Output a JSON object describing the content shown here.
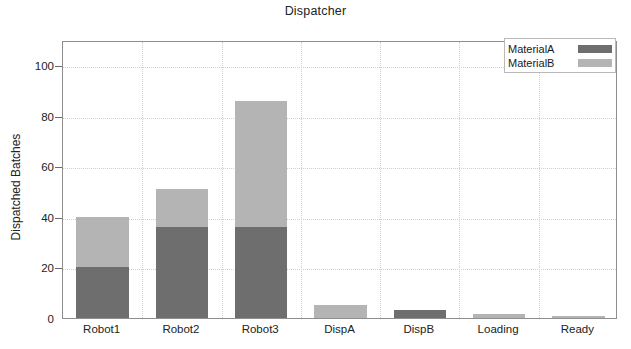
{
  "chart_data": {
    "type": "bar",
    "stacked": true,
    "title": "Dispatcher",
    "xlabel": "",
    "ylabel": "Dispatched Batches",
    "ylim": [
      0,
      110
    ],
    "yticks": [
      0,
      20,
      40,
      60,
      80,
      100
    ],
    "grid": true,
    "legend_position": "top-right",
    "categories": [
      "Robot1",
      "Robot2",
      "Robot3",
      "DispA",
      "DispB",
      "Loading",
      "Ready"
    ],
    "series": [
      {
        "name": "MaterialA",
        "color": "#6e6e6e",
        "values": [
          20,
          36,
          36,
          0,
          3,
          0,
          0
        ]
      },
      {
        "name": "MaterialB",
        "color": "#b4b4b4",
        "values": [
          20,
          15,
          50,
          5,
          0,
          1.5,
          0.8
        ]
      }
    ],
    "totals": [
      40,
      51,
      86,
      5,
      3,
      1.5,
      0.8
    ]
  },
  "axes": {
    "y_tick_labels": [
      "100",
      "80",
      "60",
      "40",
      "20",
      "0"
    ],
    "y_title": "Dispatched Batches"
  },
  "legend": {
    "items": [
      {
        "label": "MaterialA",
        "swatch": "#6e6e6e"
      },
      {
        "label": "MaterialB",
        "swatch": "#b4b4b4"
      }
    ]
  }
}
